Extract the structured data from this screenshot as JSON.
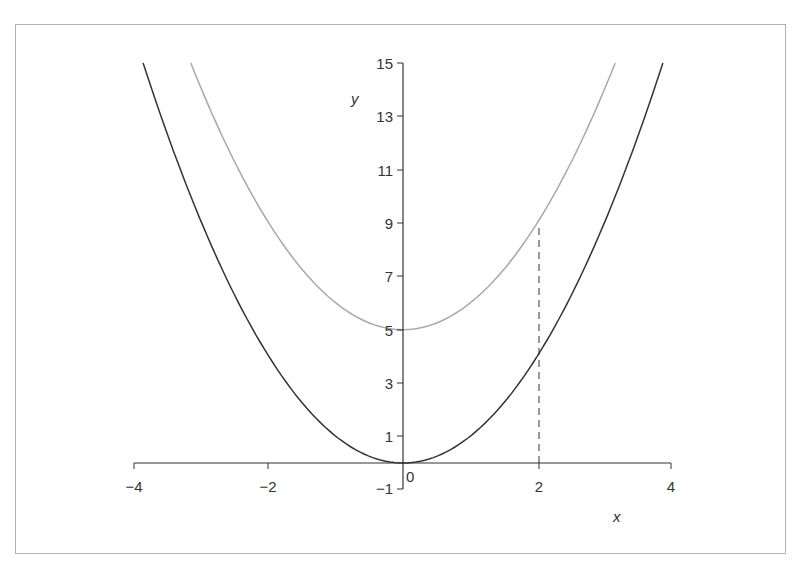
{
  "chart_data": {
    "type": "line",
    "title": "",
    "xlabel": "x",
    "ylabel": "y",
    "xlim": [
      -4,
      4
    ],
    "ylim": [
      0,
      15
    ],
    "grid": false,
    "x_ticks": [
      -4,
      -2,
      0,
      2,
      4
    ],
    "x_tick_labels": [
      "−4",
      "−2",
      "0",
      "2",
      "4"
    ],
    "y_ticks": [
      1,
      3,
      5,
      7,
      9,
      11,
      13,
      15
    ],
    "y_tick_labels": [
      "1",
      "3",
      "5",
      "7",
      "9",
      "11",
      "13",
      "15"
    ],
    "extra_tick": {
      "x": -1,
      "y": 0,
      "label": "−1"
    },
    "series": [
      {
        "name": "y = x^2",
        "color": "#333333",
        "formula": "x^2",
        "x": [
          -3.87,
          -3,
          -2,
          -1,
          0,
          1,
          2,
          3,
          3.87
        ],
        "values": [
          15,
          9,
          4,
          1,
          0,
          1,
          4,
          9,
          15
        ]
      },
      {
        "name": "y = x^2 + 5",
        "color": "#a8a8a8",
        "formula": "x^2+5",
        "x": [
          -3.16,
          -3,
          -2,
          -1,
          0,
          1,
          2,
          3,
          3.16
        ],
        "values": [
          15,
          14,
          9,
          6,
          5,
          6,
          9,
          14,
          15
        ]
      }
    ],
    "annotations": [
      {
        "type": "dashed-vertical",
        "x": 2,
        "y_from": 0,
        "y_to": 9
      }
    ]
  },
  "labels": {
    "x": "x",
    "y": "y",
    "origin": "0",
    "neg1": "−1",
    "xticks": [
      "−4",
      "−2",
      "2",
      "4"
    ],
    "yticks": [
      "1",
      "3",
      "5",
      "7",
      "9",
      "11",
      "13",
      "15"
    ]
  }
}
